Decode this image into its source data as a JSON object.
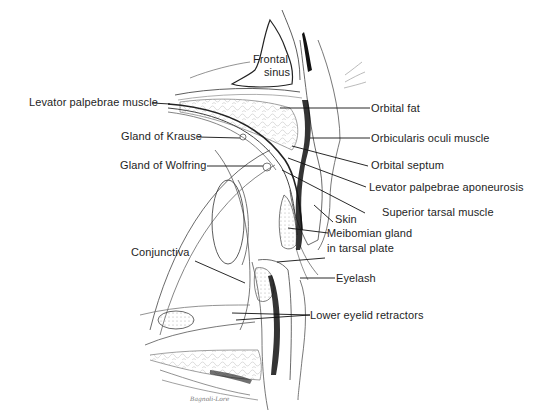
{
  "figure": {
    "labels": {
      "frontal_sinus_line1": "Frontal",
      "frontal_sinus_line2": "sinus",
      "levator_palpebrae_muscle": "Levator palpebrae muscle",
      "gland_of_krause": "Gland of Krause",
      "gland_of_wolfring": "Gland of Wolfring",
      "orbital_fat": "Orbital fat",
      "orbicularis_oculi_muscle": "Orbicularis oculi muscle",
      "orbital_septum": "Orbital septum",
      "levator_palpebrae_aponeurosis": "Levator palpebrae aponeurosis",
      "superior_tarsal_muscle": "Superior tarsal muscle",
      "skin": "Skin",
      "meibomian_gland_line1": "Meibomian gland",
      "meibomian_gland_line2": "in tarsal plate",
      "conjunctiva": "Conjunctiva",
      "eyelash": "Eyelash",
      "lower_eyelid_retractors": "Lower eyelid retractors"
    },
    "signature": "Bagnoli-Lore",
    "colors": {
      "ink": "#1e1e1e",
      "background": "#ffffff"
    }
  }
}
